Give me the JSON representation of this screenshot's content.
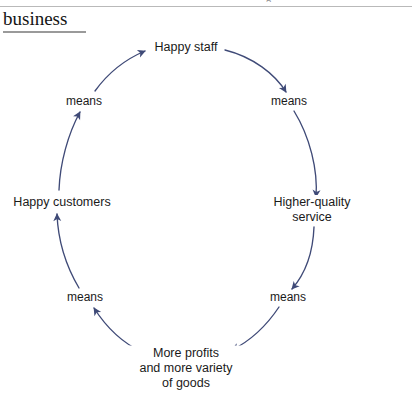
{
  "page": {
    "clipped_header_fragment": "g",
    "title": "business"
  },
  "diagram": {
    "type": "virtuous-cycle",
    "direction": "clockwise",
    "accent_color": "#3f4a77",
    "text_color": "#1a1a1a",
    "background_color": "#ffffff",
    "nodes": [
      {
        "id": "happy-staff",
        "label": "Happy staff",
        "position": "top"
      },
      {
        "id": "means-upper-right",
        "label": "means",
        "position": "upper-right"
      },
      {
        "id": "higher-quality",
        "label": "Higher-quality\nservice",
        "position": "right"
      },
      {
        "id": "means-lower-right",
        "label": "means",
        "position": "lower-right"
      },
      {
        "id": "more-profits",
        "label": "More profits\nand more variety\nof goods",
        "position": "bottom"
      },
      {
        "id": "means-lower-left",
        "label": "means",
        "position": "lower-left"
      },
      {
        "id": "happy-customers",
        "label": "Happy customers",
        "position": "left"
      },
      {
        "id": "means-upper-left",
        "label": "means",
        "position": "upper-left"
      }
    ],
    "edges": [
      {
        "from": "happy-staff",
        "to": "means-upper-right"
      },
      {
        "from": "means-upper-right",
        "to": "higher-quality"
      },
      {
        "from": "higher-quality",
        "to": "means-lower-right"
      },
      {
        "from": "means-lower-right",
        "to": "more-profits"
      },
      {
        "from": "more-profits",
        "to": "means-lower-left"
      },
      {
        "from": "means-lower-left",
        "to": "happy-customers"
      },
      {
        "from": "happy-customers",
        "to": "means-upper-left"
      },
      {
        "from": "means-upper-left",
        "to": "happy-staff"
      }
    ]
  }
}
